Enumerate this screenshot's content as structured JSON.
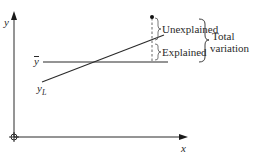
{
  "diagram": {
    "axes": {
      "y_label": "y",
      "x_label": "x"
    },
    "lines": {
      "mean_label": "y",
      "regression_label": "y",
      "regression_subscript": "L"
    },
    "annotations": {
      "unexplained": "Unexplained",
      "explained": "Explained",
      "total_line1": "Total",
      "total_line2": "variation"
    },
    "colors": {
      "stroke": "#2a2a2a",
      "background": "#ffffff"
    }
  }
}
